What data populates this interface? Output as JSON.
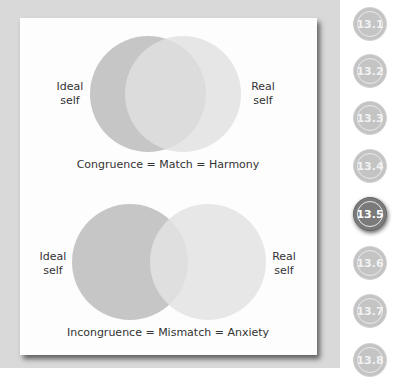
{
  "figure": {
    "top_diagram": {
      "left_label": "Ideal\nself",
      "left_label_line1": "Ideal",
      "left_label_line2": "self",
      "right_label_line1": "Real",
      "right_label_line2": "self",
      "caption": "Congruence = Match = Harmony",
      "circles": [
        {
          "name": "ideal-self",
          "cx": 148,
          "cy": 94,
          "r": 58,
          "color": "#c6c6c6"
        },
        {
          "name": "real-self",
          "cx": 183,
          "cy": 94,
          "r": 58,
          "color": "#dedede"
        }
      ]
    },
    "bottom_diagram": {
      "left_label_line1": "Ideal",
      "left_label_line2": "self",
      "right_label_line1": "Real",
      "right_label_line2": "self",
      "caption": "Incongruence = Mismatch = Anxiety",
      "circles": [
        {
          "name": "ideal-self",
          "cx": 130,
          "cy": 262,
          "r": 58,
          "color": "#c6c6c6"
        },
        {
          "name": "real-self",
          "cx": 208,
          "cy": 262,
          "r": 58,
          "color": "#e3e3e3"
        }
      ]
    }
  },
  "section_nav": {
    "items": [
      {
        "label": "13.1",
        "active": false
      },
      {
        "label": "13.2",
        "active": false
      },
      {
        "label": "13.3",
        "active": false
      },
      {
        "label": "13.4",
        "active": false
      },
      {
        "label": "13.5",
        "active": true
      },
      {
        "label": "13.6",
        "active": false
      },
      {
        "label": "13.7",
        "active": false
      },
      {
        "label": "13.8",
        "active": false
      }
    ]
  }
}
